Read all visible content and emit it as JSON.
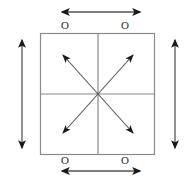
{
  "figure": {
    "background_color": "#ffffff",
    "outline_color": "#8a8a8a",
    "arrow_color": "#1a1a1a",
    "label_color": "#2b2b2b"
  },
  "square": {
    "left": 40,
    "top": 33,
    "right": 155,
    "bottom": 155,
    "width": 115,
    "height": 122,
    "center_x": 98,
    "center_y": 94,
    "quadrant_count": 4,
    "divider_vertical_x": 98,
    "divider_horizontal_y": 94
  },
  "labels": {
    "top_left": "O",
    "top_right": "O",
    "bottom_left": "O",
    "bottom_right": "O"
  },
  "arrows": {
    "top": {
      "name": "top-horizontal-double-arrow",
      "orientation": "horizontal",
      "heads": "both",
      "x1": 62,
      "y1": 12,
      "x2": 140,
      "y2": 12
    },
    "bottom": {
      "name": "bottom-horizontal-double-arrow",
      "orientation": "horizontal",
      "heads": "both",
      "x1": 62,
      "y1": 171,
      "x2": 140,
      "y2": 171
    },
    "left": {
      "name": "left-vertical-double-arrow",
      "orientation": "vertical",
      "heads": "both",
      "x1": 22,
      "y1": 40,
      "x2": 22,
      "y2": 148
    },
    "right": {
      "name": "right-vertical-double-arrow",
      "orientation": "vertical",
      "heads": "both",
      "x1": 175,
      "y1": 40,
      "x2": 175,
      "y2": 148
    },
    "diagonals": [
      {
        "name": "diagonal-arrow-up-left",
        "direction": "up-left",
        "from_x": 98,
        "from_y": 94,
        "to_x": 63,
        "to_y": 55
      },
      {
        "name": "diagonal-arrow-up-right",
        "direction": "up-right",
        "from_x": 98,
        "from_y": 94,
        "to_x": 133,
        "to_y": 55
      },
      {
        "name": "diagonal-arrow-down-left",
        "direction": "down-left",
        "from_x": 98,
        "from_y": 94,
        "to_x": 63,
        "to_y": 133
      },
      {
        "name": "diagonal-arrow-down-right",
        "direction": "down-right",
        "from_x": 98,
        "from_y": 94,
        "to_x": 133,
        "to_y": 133
      }
    ]
  }
}
